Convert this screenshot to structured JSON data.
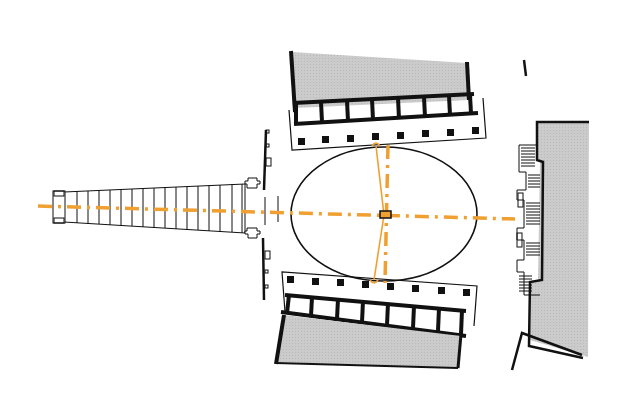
{
  "diagram": {
    "type": "architectural-site-plan",
    "description": "Plan of an elliptical piazza flanked by two colonnade wings, with a bridge approach on the left and a building facade on the right; orange dash-dot axes mark symmetry lines.",
    "colors": {
      "background": "#ffffff",
      "line": "#111111",
      "building_fill": "#c9c9c9",
      "axis": "#f0a030"
    },
    "elements": {
      "bridge": {
        "label": "bridge-approach",
        "segments": 18
      },
      "piazza": {
        "label": "elliptical-piazza",
        "cx": 384,
        "cy": 216,
        "rx": 92,
        "ry": 68
      },
      "north_wing": {
        "label": "north-colonnade-wing",
        "bays": 7,
        "columns": 8
      },
      "south_wing": {
        "label": "south-colonnade-wing",
        "bays": 7,
        "columns": 8
      },
      "east_building": {
        "label": "east-building-facade"
      },
      "main_axis": {
        "label": "longitudinal-axis"
      },
      "cross_axis": {
        "label": "transverse-axis"
      }
    }
  }
}
